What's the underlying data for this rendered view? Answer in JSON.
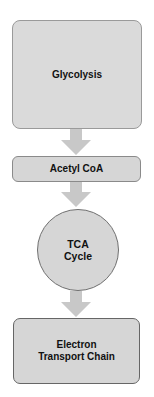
{
  "diagram": {
    "type": "vertical-flowchart",
    "colors": {
      "node_fill": "#d6d6d6",
      "arrow_fill": "#c8c8c8",
      "node_border": "#7a7a7a",
      "text": "#111111"
    },
    "nodes": [
      {
        "id": "glycolysis",
        "shape": "rounded-rect",
        "lines": [
          "Glycolysis"
        ]
      },
      {
        "id": "acetyl",
        "shape": "rounded-rect",
        "lines": [
          "Acetyl CoA"
        ]
      },
      {
        "id": "tca",
        "shape": "circle",
        "lines": [
          "TCA",
          "Cycle"
        ]
      },
      {
        "id": "etc",
        "shape": "rounded-rect",
        "lines": [
          "Electron",
          "Transport Chain"
        ]
      }
    ],
    "edges": [
      {
        "from": "glycolysis",
        "to": "acetyl"
      },
      {
        "from": "acetyl",
        "to": "tca"
      },
      {
        "from": "tca",
        "to": "etc"
      }
    ]
  }
}
